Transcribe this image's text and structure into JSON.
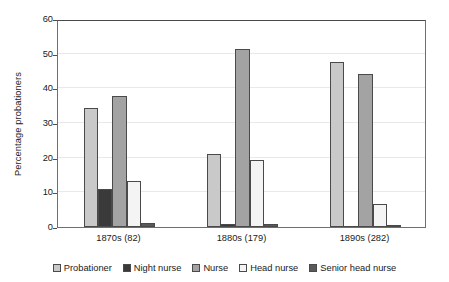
{
  "chart_data": {
    "type": "bar",
    "title": "",
    "subtitle": "",
    "xlabel": "",
    "ylabel": "Percentage probationers",
    "categories": [
      "1870s (82)",
      "1880s (179)",
      "1890s (282)"
    ],
    "series": [
      {
        "name": "Probationer",
        "color": "#c9c9c9",
        "values": [
          34.2,
          21.2,
          47.6
        ]
      },
      {
        "name": "Night nurse",
        "color": "#3a3a3a",
        "values": [
          11.0,
          1.0,
          0.0
        ]
      },
      {
        "name": "Nurse",
        "color": "#a3a3a3",
        "values": [
          37.8,
          51.4,
          44.0
        ]
      },
      {
        "name": "Head nurse",
        "color": "#f4f4f4",
        "values": [
          13.4,
          19.4,
          6.5
        ]
      },
      {
        "name": "Senior head nurse",
        "color": "#5a5a5a",
        "values": [
          1.1,
          1.0,
          0.5
        ]
      }
    ],
    "ylim": [
      0,
      60
    ],
    "yticks": [
      0,
      10,
      20,
      30,
      40,
      50,
      60
    ],
    "ytick_labels": [
      "0",
      "10",
      "20",
      "30",
      "40",
      "50",
      "60"
    ],
    "grid": true,
    "grid_axis": "y",
    "legend_position": "bottom",
    "bar_edge_color": "#4a4a4a",
    "axis_color": "#6f6f6f",
    "grid_color": "#e9e9e9",
    "background": "#ffffff"
  }
}
